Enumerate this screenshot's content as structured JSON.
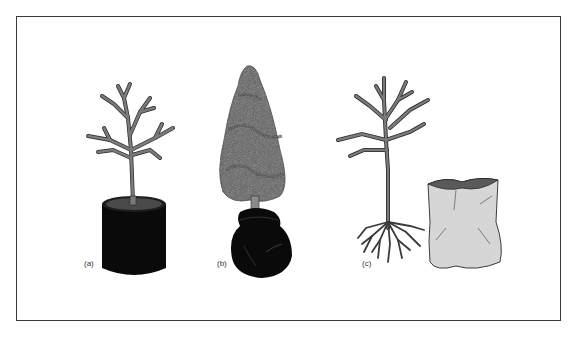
{
  "figure": {
    "panels": [
      {
        "id": "a",
        "label": "(a)",
        "description": "Bare-branched tree in a black container pot"
      },
      {
        "id": "b",
        "label": "(b)",
        "description": "Conifer with balled-and-burlapped root ball"
      },
      {
        "id": "c",
        "label": "(c)",
        "description": "Bare-root tree beside a planting bag"
      }
    ]
  },
  "colors": {
    "frame": "#3a3a3a",
    "trunk": "#7a7a7a",
    "outline": "#2a2a2a",
    "pot": "#0a0a0a",
    "foliage": "#5e5e5e",
    "bag": "#d6d6d6"
  }
}
